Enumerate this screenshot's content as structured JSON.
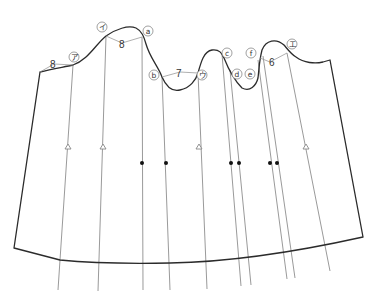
{
  "diagram": {
    "title": "",
    "colors": {
      "outline": "#2b2b2b",
      "guide": "#9a9a9a",
      "dot": "#111111",
      "background": "#ffffff"
    },
    "measurements": [
      {
        "id": "m1",
        "value": "8",
        "between": [
          "left-corner",
          "ア"
        ]
      },
      {
        "id": "m2",
        "value": "8",
        "between": [
          "イ",
          "a"
        ]
      },
      {
        "id": "m3",
        "value": "7",
        "between": [
          "b",
          "ウ"
        ]
      },
      {
        "id": "m4",
        "value": "6",
        "between": [
          "f",
          "エ"
        ]
      }
    ],
    "point_labels": [
      {
        "id": "a",
        "text": "a"
      },
      {
        "id": "b",
        "text": "b"
      },
      {
        "id": "c",
        "text": "c"
      },
      {
        "id": "d",
        "text": "d"
      },
      {
        "id": "e",
        "text": "e"
      },
      {
        "id": "f",
        "text": "f"
      },
      {
        "id": "ア",
        "text": "ア"
      },
      {
        "id": "イ",
        "text": "イ"
      },
      {
        "id": "ウ",
        "text": "ウ"
      },
      {
        "id": "エ",
        "text": "エ"
      }
    ],
    "markers": {
      "triangles": 4,
      "dots": 6
    }
  }
}
